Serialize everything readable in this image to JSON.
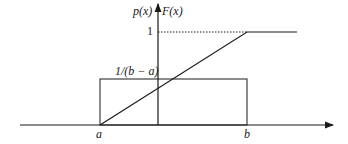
{
  "diagram": {
    "axes": {
      "y_label_left": "p(x)",
      "y_label_right": "F(x)"
    },
    "labels": {
      "one": "1",
      "density_height": "1/(b − a)",
      "a": "a",
      "b": "b"
    },
    "colors": {
      "line": "#1a1a1a",
      "background": "#ffffff"
    }
  }
}
